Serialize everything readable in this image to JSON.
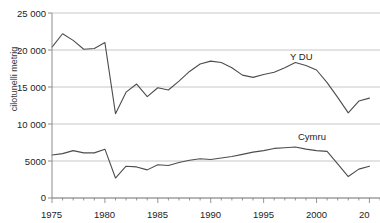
{
  "title": {
    "text": "",
    "note": "clipped-at-top"
  },
  "axes": {
    "ylabel": "cilotunelli metrig",
    "yticks": [
      "25 000",
      "20 000",
      "15 000",
      "10 000",
      "5000",
      "0"
    ],
    "xticks": [
      "1975",
      "1980",
      "1985",
      "1990",
      "1995",
      "2000",
      "20"
    ]
  },
  "labels": {
    "uk": "Y DU",
    "cymru": "Cymru"
  },
  "colors": {
    "line": "#4d4d4d",
    "grid": "#b9b9b9",
    "axis": "#8c8c8c",
    "text": "#1d1d1d"
  },
  "chart_data": {
    "type": "line",
    "title": "",
    "xlabel": "",
    "ylabel": "cilotunelli metrig",
    "xlim": [
      1975,
      2006
    ],
    "ylim": [
      0,
      25000
    ],
    "ytick_values": [
      0,
      5000,
      10000,
      15000,
      20000,
      25000
    ],
    "xtick_values": [
      1975,
      1980,
      1985,
      1990,
      1995,
      2000,
      2005
    ],
    "grid": true,
    "legend": "inline-annotations",
    "x": [
      1975,
      1976,
      1977,
      1978,
      1979,
      1980,
      1981,
      1982,
      1983,
      1984,
      1985,
      1986,
      1987,
      1988,
      1989,
      1990,
      1991,
      1992,
      1993,
      1994,
      1995,
      1996,
      1997,
      1998,
      1999,
      2000,
      2001,
      2002,
      2003,
      2004,
      2005
    ],
    "series": [
      {
        "name": "Y DU",
        "values": [
          20400,
          22200,
          21300,
          20100,
          20200,
          21000,
          11400,
          14300,
          15400,
          13700,
          14900,
          14600,
          15800,
          17100,
          18100,
          18500,
          18300,
          17600,
          16600,
          16300,
          16700,
          17000,
          17600,
          18300,
          17900,
          17300,
          15600,
          13600,
          11500,
          13100,
          13500
        ]
      },
      {
        "name": "Cymru",
        "values": [
          5800,
          6000,
          6400,
          6100,
          6100,
          6600,
          2700,
          4300,
          4200,
          3800,
          4500,
          4400,
          4800,
          5100,
          5300,
          5200,
          5400,
          5600,
          5900,
          6200,
          6400,
          6700,
          6800,
          6900,
          6600,
          6400,
          6300,
          4600,
          2900,
          3900,
          4300
        ]
      }
    ]
  }
}
